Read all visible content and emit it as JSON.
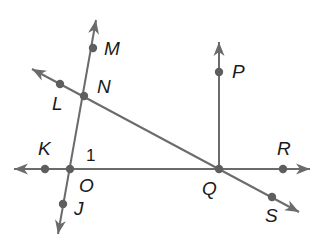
{
  "diagram": {
    "type": "geometry-lines-and-rays",
    "stroke_color": "#6b6b6b",
    "point_color": "#5e5e5e",
    "label_color": "#1a1a1a",
    "points": [
      {
        "name": "M",
        "x": 93,
        "y": 48,
        "label_x": 104,
        "label_y": 55
      },
      {
        "name": "N",
        "x": 84,
        "y": 96,
        "label_x": 97,
        "label_y": 93
      },
      {
        "name": "L",
        "x": 60,
        "y": 84,
        "label_x": 52,
        "label_y": 110
      },
      {
        "name": "K",
        "x": 45,
        "y": 169,
        "label_x": 38,
        "label_y": 155
      },
      {
        "name": "O",
        "x": 70,
        "y": 169,
        "label_x": 79,
        "label_y": 192
      },
      {
        "name": "J",
        "x": 63,
        "y": 204,
        "label_x": 74,
        "label_y": 215
      },
      {
        "name": "P",
        "x": 219,
        "y": 72,
        "label_x": 232,
        "label_y": 78
      },
      {
        "name": "Q",
        "x": 219,
        "y": 169,
        "label_x": 202,
        "label_y": 195
      },
      {
        "name": "R",
        "x": 283,
        "y": 169,
        "label_x": 277,
        "label_y": 155
      },
      {
        "name": "S",
        "x": 272,
        "y": 197,
        "label_x": 265,
        "label_y": 222
      }
    ],
    "angle_labels": [
      {
        "name": "1",
        "x": 86,
        "y": 161
      }
    ],
    "lines": [
      {
        "name": "line-MJ",
        "through": [
          "M",
          "N",
          "O",
          "J"
        ],
        "x1": 96,
        "y1": 20,
        "x2": 58,
        "y2": 234,
        "arrows": "both"
      },
      {
        "name": "line-LS",
        "through": [
          "L",
          "N",
          "Q",
          "S"
        ],
        "x1": 32,
        "y1": 69,
        "x2": 299,
        "y2": 212,
        "arrows": "both"
      },
      {
        "name": "line-KR",
        "through": [
          "K",
          "O",
          "Q",
          "R"
        ],
        "x1": 14,
        "y1": 169,
        "x2": 310,
        "y2": 169,
        "arrows": "both"
      },
      {
        "name": "ray-QP",
        "through": [
          "Q",
          "P"
        ],
        "x1": 219,
        "y1": 169,
        "x2": 219,
        "y2": 42,
        "arrows": "end"
      }
    ]
  }
}
